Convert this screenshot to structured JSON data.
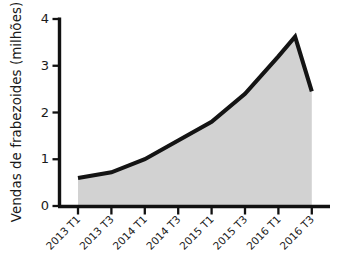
{
  "chart_data": {
    "type": "area",
    "title": "",
    "xlabel": "",
    "ylabel": "Vendas de frabezoides (milhões)",
    "categories": [
      "2013 T1",
      "2013 T3",
      "2014 T1",
      "2014 T3",
      "2015 T1",
      "2015 T3",
      "2016 T1",
      "2016 T3"
    ],
    "x_tick_labels": [
      "2013 T1",
      "2013 T3",
      "2014 T1",
      "2014 T3",
      "2015 T1",
      "2015 T3",
      "2016 T1",
      "2016 T3"
    ],
    "y_tick_labels": [
      "0",
      "1",
      "2",
      "3",
      "4"
    ],
    "y_ticks": [
      0,
      1,
      2,
      3,
      4
    ],
    "ylim": [
      0,
      4
    ],
    "values": [
      0.6,
      0.72,
      1.0,
      1.4,
      1.8,
      2.4,
      3.2,
      2.45
    ],
    "series": [
      {
        "name": "Vendas de frabezoides",
        "values": [
          0.6,
          0.72,
          1.0,
          1.4,
          1.8,
          2.4,
          3.2,
          2.45
        ]
      }
    ],
    "peak": {
      "label": "peak",
      "x_fraction": 6.5,
      "value": 3.62
    },
    "vertices": [
      {
        "x_index": 0,
        "value": 0.6
      },
      {
        "x_index": 1,
        "value": 0.72
      },
      {
        "x_index": 2,
        "value": 1.0
      },
      {
        "x_index": 3,
        "value": 1.4
      },
      {
        "x_index": 4,
        "value": 1.8
      },
      {
        "x_index": 5,
        "value": 2.4
      },
      {
        "x_index": 6,
        "value": 3.2
      },
      {
        "x_index": 6.5,
        "value": 3.62
      },
      {
        "x_index": 7,
        "value": 2.45
      }
    ],
    "grid": false,
    "legend": false,
    "legend_position": "none",
    "colors": {
      "area_fill": "#d2d2d2",
      "line": "#141414",
      "axis": "#111111",
      "text": "#1a1a1a",
      "background": "#ffffff"
    }
  }
}
